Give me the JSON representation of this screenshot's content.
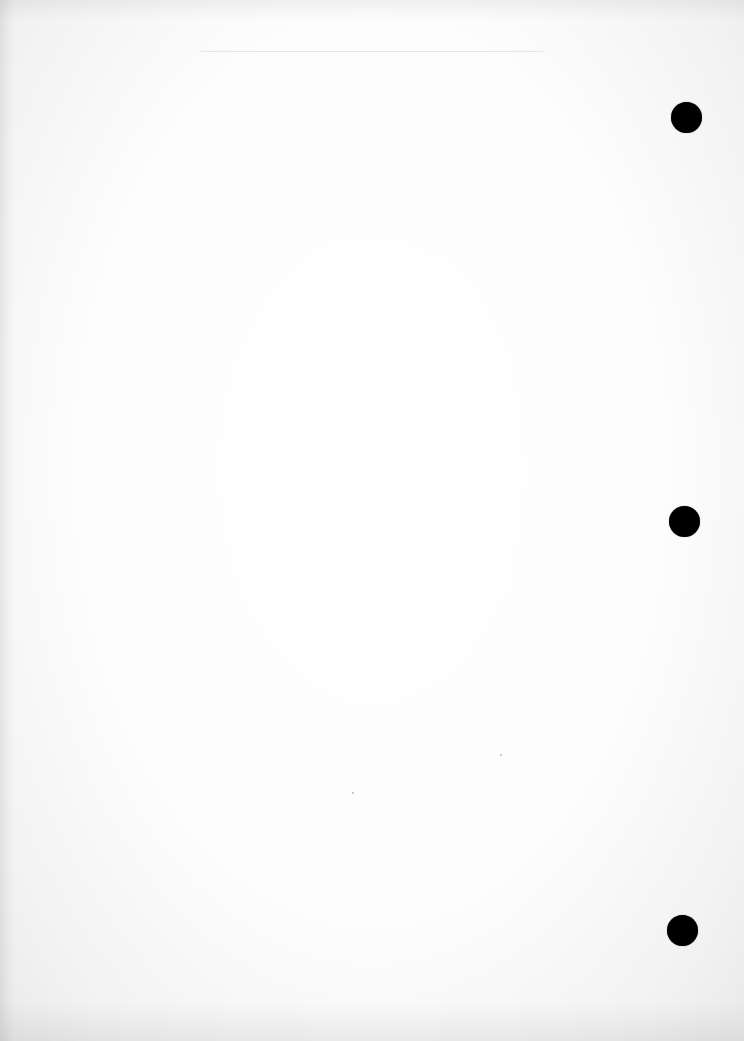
{
  "page": {
    "type": "blank scanned sheet",
    "background_color": "#ffffff",
    "text": ""
  },
  "top_rule": {
    "x": 200,
    "y": 51,
    "width": 345,
    "color": "#e6e6e6"
  },
  "punch_holes": [
    {
      "cx": 686,
      "cy": 117,
      "diameter": 31,
      "color": "#000000"
    },
    {
      "cx": 684,
      "cy": 521,
      "diameter": 31,
      "color": "#000000"
    },
    {
      "cx": 682,
      "cy": 930,
      "diameter": 31,
      "color": "#000000"
    }
  ],
  "specks": [
    {
      "x": 500,
      "y": 754
    },
    {
      "x": 352,
      "y": 792
    }
  ]
}
